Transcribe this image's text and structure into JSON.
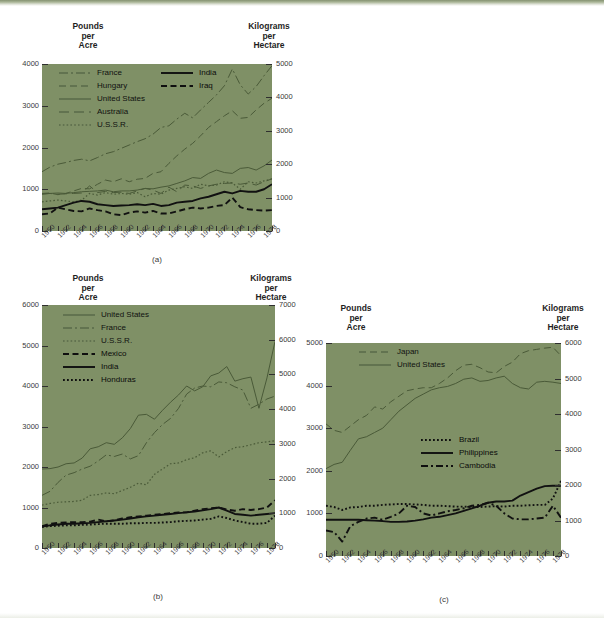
{
  "page": {
    "background_color": "#ffffff",
    "plot_background_color": "#7f9066",
    "line_color_light": "#4a5a38",
    "line_color_dark": "#111111"
  },
  "axis_titles": {
    "left_line1": "Pounds",
    "left_line2": "per",
    "left_line3": "Acre",
    "right_line1": "Kilograms",
    "right_line2": "per",
    "right_line3": "Hectare"
  },
  "captions": {
    "a": "(a)",
    "b": "(b)",
    "c": "(c)"
  },
  "chart_data": [
    {
      "id": "a",
      "type": "line",
      "title": "",
      "caption": "(a)",
      "xlabel": "",
      "ylabel": "Pounds per Acre",
      "y2label": "Kilograms per Hectare",
      "xlim": [
        1950,
        1979
      ],
      "ylim": [
        0,
        4000
      ],
      "y2lim": [
        0,
        5000
      ],
      "yticks": [
        0,
        1000,
        2000,
        3000,
        4000
      ],
      "y2ticks": [
        0,
        1000,
        2000,
        3000,
        4000,
        5000
      ],
      "x": [
        1950,
        1951,
        1952,
        1953,
        1954,
        1955,
        1956,
        1957,
        1958,
        1959,
        1960,
        1961,
        1962,
        1963,
        1964,
        1965,
        1966,
        1967,
        1968,
        1969,
        1970,
        1971,
        1972,
        1973,
        1974,
        1975,
        1976,
        1977,
        1978,
        1979
      ],
      "xticks": [
        1950,
        1952,
        1954,
        1956,
        1958,
        1960,
        1962,
        1964,
        1966,
        1968,
        1970,
        1972,
        1974,
        1976,
        1978
      ],
      "grid": false,
      "legend_position": "top-inside",
      "series": [
        {
          "name": "France",
          "style": "dash-dot",
          "color": "#4a5a38",
          "values": [
            1420,
            1530,
            1600,
            1640,
            1690,
            1720,
            1680,
            1760,
            1850,
            1900,
            1980,
            2060,
            2140,
            2210,
            2320,
            2480,
            2520,
            2680,
            2820,
            2710,
            2900,
            3080,
            3260,
            3480,
            3880,
            3500,
            3280,
            3460,
            3720,
            3960
          ]
        },
        {
          "name": "Hungary",
          "style": "dashed",
          "color": "#4a5a38",
          "values": [
            900,
            910,
            870,
            900,
            960,
            1020,
            1010,
            1120,
            1220,
            1180,
            1250,
            1180,
            1240,
            1260,
            1380,
            1420,
            1620,
            1800,
            1960,
            2100,
            2280,
            2480,
            2620,
            2760,
            2880,
            2700,
            2720,
            2900,
            3060,
            3180
          ]
        },
        {
          "name": "United States",
          "style": "solid",
          "color": "#4a5a38",
          "values": [
            890,
            900,
            910,
            900,
            920,
            940,
            950,
            960,
            980,
            940,
            960,
            960,
            980,
            1020,
            1010,
            1050,
            1080,
            1140,
            1200,
            1280,
            1260,
            1380,
            1460,
            1400,
            1380,
            1500,
            1520,
            1460,
            1560,
            1700
          ]
        },
        {
          "name": "Australia",
          "style": "long-dash",
          "color": "#4a5a38",
          "values": [
            880,
            900,
            880,
            890,
            900,
            910,
            1080,
            920,
            950,
            920,
            930,
            900,
            960,
            1020,
            980,
            900,
            1050,
            940,
            1100,
            1080,
            1020,
            1080,
            1120,
            1140,
            1150,
            1120,
            1150,
            1100,
            1180,
            1250
          ]
        },
        {
          "name": "U.S.S.R.",
          "style": "dotted",
          "color": "#4a5a38",
          "values": [
            700,
            720,
            740,
            720,
            700,
            740,
            900,
            860,
            920,
            880,
            900,
            880,
            920,
            820,
            900,
            880,
            980,
            1020,
            1060,
            1020,
            1120,
            1080,
            1100,
            1180,
            1150,
            1000,
            1180,
            1150,
            1200,
            1250
          ]
        },
        {
          "name": "India",
          "style": "solid-dark",
          "color": "#111111",
          "values": [
            520,
            540,
            560,
            620,
            680,
            720,
            700,
            640,
            620,
            600,
            610,
            620,
            640,
            620,
            650,
            600,
            620,
            680,
            700,
            720,
            780,
            820,
            880,
            940,
            900,
            960,
            940,
            940,
            1000,
            1120
          ]
        },
        {
          "name": "Iraq",
          "style": "dashed-dark",
          "color": "#111111",
          "values": [
            400,
            420,
            560,
            520,
            480,
            470,
            540,
            500,
            470,
            400,
            380,
            440,
            470,
            440,
            480,
            420,
            420,
            470,
            520,
            560,
            540,
            560,
            600,
            620,
            800,
            570,
            520,
            500,
            490,
            500
          ]
        }
      ],
      "legend": [
        {
          "name": "France",
          "style": "dash-dot",
          "column": 1
        },
        {
          "name": "Hungary",
          "style": "dashed",
          "column": 1
        },
        {
          "name": "United States",
          "style": "solid",
          "column": 1
        },
        {
          "name": "Australia",
          "style": "long-dash",
          "column": 1
        },
        {
          "name": "U.S.S.R.",
          "style": "dotted",
          "column": 1
        },
        {
          "name": "India",
          "style": "solid-dark",
          "column": 2
        },
        {
          "name": "Iraq",
          "style": "dashed-dark",
          "column": 2
        }
      ]
    },
    {
      "id": "b",
      "type": "line",
      "title": "",
      "caption": "(b)",
      "xlabel": "",
      "ylabel": "Pounds per Acre",
      "y2label": "Kilograms per Hectare",
      "xlim": [
        1950,
        1979
      ],
      "ylim": [
        0,
        6000
      ],
      "y2lim": [
        0,
        7000
      ],
      "yticks": [
        0,
        1000,
        2000,
        3000,
        4000,
        5000,
        6000
      ],
      "y2ticks": [
        0,
        1000,
        2000,
        3000,
        4000,
        5000,
        6000,
        7000
      ],
      "x": [
        1950,
        1951,
        1952,
        1953,
        1954,
        1955,
        1956,
        1957,
        1958,
        1959,
        1960,
        1961,
        1962,
        1963,
        1964,
        1965,
        1966,
        1967,
        1968,
        1969,
        1970,
        1971,
        1972,
        1973,
        1974,
        1975,
        1976,
        1977,
        1978,
        1979
      ],
      "xticks": [
        1950,
        1952,
        1954,
        1956,
        1958,
        1960,
        1962,
        1964,
        1966,
        1968,
        1970,
        1972,
        1974,
        1976,
        1978
      ],
      "grid": false,
      "legend_position": "top-inside",
      "series": [
        {
          "name": "United States",
          "style": "solid",
          "color": "#4a5a38",
          "values": [
            1950,
            1960,
            2000,
            2080,
            2100,
            2220,
            2450,
            2500,
            2600,
            2560,
            2720,
            2950,
            3280,
            3300,
            3180,
            3400,
            3600,
            3780,
            4000,
            3880,
            3980,
            4250,
            4320,
            4480,
            4120,
            4180,
            4220,
            3450,
            4200,
            5100
          ]
        },
        {
          "name": "France",
          "style": "dash-dot",
          "color": "#4a5a38",
          "values": [
            1300,
            1400,
            1620,
            1800,
            1860,
            1950,
            2020,
            2150,
            2300,
            2260,
            2320,
            2200,
            2280,
            2600,
            2850,
            3050,
            3200,
            3450,
            3800,
            3950,
            4000,
            3980,
            4100,
            4080,
            3980,
            3900,
            3450,
            3550,
            3680,
            3750
          ]
        },
        {
          "name": "U.S.S.R.",
          "style": "dotted",
          "color": "#4a5a38",
          "values": [
            1060,
            1100,
            1130,
            1140,
            1150,
            1180,
            1300,
            1320,
            1360,
            1340,
            1420,
            1500,
            1600,
            1560,
            1820,
            1950,
            2080,
            2100,
            2180,
            2230,
            2350,
            2400,
            2250,
            2380,
            2480,
            2500,
            2550,
            2600,
            2620,
            2650
          ]
        },
        {
          "name": "Mexico",
          "style": "dashed-dark",
          "color": "#111111",
          "values": [
            540,
            600,
            620,
            630,
            640,
            640,
            650,
            700,
            660,
            680,
            730,
            760,
            780,
            800,
            820,
            840,
            860,
            880,
            880,
            920,
            960,
            980,
            1000,
            950,
            920,
            960,
            940,
            960,
            1000,
            1180
          ]
        },
        {
          "name": "India",
          "style": "solid-dark",
          "color": "#111111",
          "values": [
            530,
            560,
            580,
            600,
            600,
            610,
            620,
            640,
            660,
            680,
            700,
            730,
            760,
            780,
            800,
            820,
            840,
            860,
            880,
            900,
            930,
            960,
            1000,
            920,
            840,
            820,
            800,
            820,
            840,
            860
          ]
        },
        {
          "name": "Honduras",
          "style": "dotted-dark",
          "color": "#111111",
          "values": [
            520,
            540,
            550,
            560,
            560,
            570,
            580,
            590,
            600,
            600,
            600,
            610,
            610,
            620,
            620,
            630,
            640,
            660,
            670,
            680,
            700,
            720,
            780,
            740,
            680,
            640,
            600,
            600,
            620,
            800
          ]
        }
      ],
      "legend": [
        {
          "name": "United States",
          "style": "solid",
          "column": 1
        },
        {
          "name": "France",
          "style": "dash-dot",
          "column": 1
        },
        {
          "name": "U.S.S.R.",
          "style": "dotted",
          "column": 1
        },
        {
          "name": "Mexico",
          "style": "dashed-dark",
          "column": 1
        },
        {
          "name": "India",
          "style": "solid-dark",
          "column": 1
        },
        {
          "name": "Honduras",
          "style": "dotted-dark",
          "column": 1
        }
      ]
    },
    {
      "id": "c",
      "type": "line",
      "title": "",
      "caption": "(c)",
      "xlabel": "",
      "ylabel": "Pounds per Acre",
      "y2label": "Kilograms per Hectare",
      "xlim": [
        1950,
        1979
      ],
      "ylim": [
        0,
        5000
      ],
      "y2lim": [
        0,
        6000
      ],
      "yticks": [
        0,
        1000,
        2000,
        3000,
        4000,
        5000
      ],
      "y2ticks": [
        0,
        1000,
        2000,
        3000,
        4000,
        5000,
        6000
      ],
      "x": [
        1950,
        1951,
        1952,
        1953,
        1954,
        1955,
        1956,
        1957,
        1958,
        1959,
        1960,
        1961,
        1962,
        1963,
        1964,
        1965,
        1966,
        1967,
        1968,
        1969,
        1970,
        1971,
        1972,
        1973,
        1974,
        1975,
        1976,
        1977,
        1978,
        1979
      ],
      "xticks": [
        1950,
        1952,
        1954,
        1956,
        1958,
        1960,
        1962,
        1964,
        1966,
        1968,
        1970,
        1972,
        1974,
        1976,
        1978
      ],
      "grid": false,
      "legend_position": "split-inside",
      "series": [
        {
          "name": "Japan",
          "style": "dashed",
          "color": "#4a5a38",
          "values": [
            3100,
            2950,
            2900,
            3050,
            3200,
            3300,
            3500,
            3450,
            3620,
            3750,
            3880,
            3920,
            3950,
            3950,
            4050,
            4180,
            4350,
            4480,
            4500,
            4420,
            4320,
            4300,
            4450,
            4550,
            4750,
            4820,
            4850,
            4880,
            4900,
            4700
          ]
        },
        {
          "name": "United States",
          "style": "solid",
          "color": "#4a5a38",
          "values": [
            2050,
            2150,
            2200,
            2480,
            2750,
            2800,
            2900,
            3000,
            3200,
            3400,
            3550,
            3700,
            3800,
            3900,
            3950,
            3980,
            4050,
            4150,
            4180,
            4100,
            4120,
            4180,
            4220,
            4050,
            3950,
            3920,
            4080,
            4100,
            4080,
            4050
          ]
        },
        {
          "name": "Brazil",
          "style": "dotted-dark",
          "color": "#111111",
          "values": [
            1180,
            1150,
            1080,
            1140,
            1150,
            1180,
            1180,
            1200,
            1210,
            1220,
            1220,
            1210,
            1200,
            1180,
            1180,
            1170,
            1160,
            1160,
            1150,
            1150,
            1160,
            1170,
            1160,
            1180,
            1180,
            1190,
            1200,
            1200,
            1350,
            1760
          ]
        },
        {
          "name": "Philippines",
          "style": "solid-dark",
          "color": "#111111",
          "values": [
            850,
            850,
            850,
            850,
            850,
            840,
            830,
            820,
            800,
            800,
            810,
            830,
            860,
            900,
            920,
            960,
            1000,
            1060,
            1120,
            1180,
            1250,
            1280,
            1280,
            1300,
            1420,
            1500,
            1580,
            1640,
            1650,
            1650
          ]
        },
        {
          "name": "Cambodia",
          "style": "dash-dot-dark",
          "color": "#111111",
          "values": [
            600,
            560,
            340,
            700,
            800,
            880,
            900,
            850,
            920,
            1000,
            1180,
            1150,
            1000,
            950,
            1000,
            1050,
            1080,
            1120,
            1180,
            1200,
            1250,
            1180,
            1000,
            880,
            860,
            860,
            880,
            900,
            1180,
            900
          ]
        }
      ],
      "legend_top": [
        {
          "name": "Japan",
          "style": "dashed"
        },
        {
          "name": "United States",
          "style": "solid"
        }
      ],
      "legend_bottom": [
        {
          "name": "Brazil",
          "style": "dotted-dark"
        },
        {
          "name": "Philippines",
          "style": "solid-dark"
        },
        {
          "name": "Cambodia",
          "style": "dash-dot-dark"
        }
      ]
    }
  ]
}
